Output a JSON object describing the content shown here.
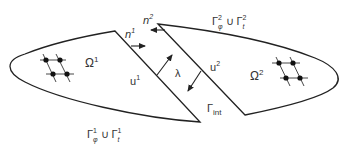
{
  "diagram": {
    "domain1": {
      "label": "Ω",
      "sup": "1",
      "displacement": "u",
      "displacement_sup": "1",
      "normal": "n",
      "normal_sup": "1",
      "boundary": {
        "g1": "Γ",
        "g1_sub": "φ",
        "g1_sup": "1",
        "union": "∪",
        "g2": "Γ",
        "g2_sub": "t",
        "g2_sup": "1"
      }
    },
    "domain2": {
      "label": "Ω",
      "sup": "2",
      "displacement": "u",
      "displacement_sup": "2",
      "normal": "n",
      "normal_sup": "2",
      "boundary": {
        "g1": "Γ",
        "g1_sub": "φ",
        "g1_sup": "2",
        "union": "∪",
        "g2": "Γ",
        "g2_sub": "t",
        "g2_sup": "2"
      }
    },
    "multiplier": "λ",
    "interface": {
      "label": "Γ",
      "sub": "int"
    },
    "colors": {
      "stroke": "#222222",
      "text": "#333333"
    }
  }
}
